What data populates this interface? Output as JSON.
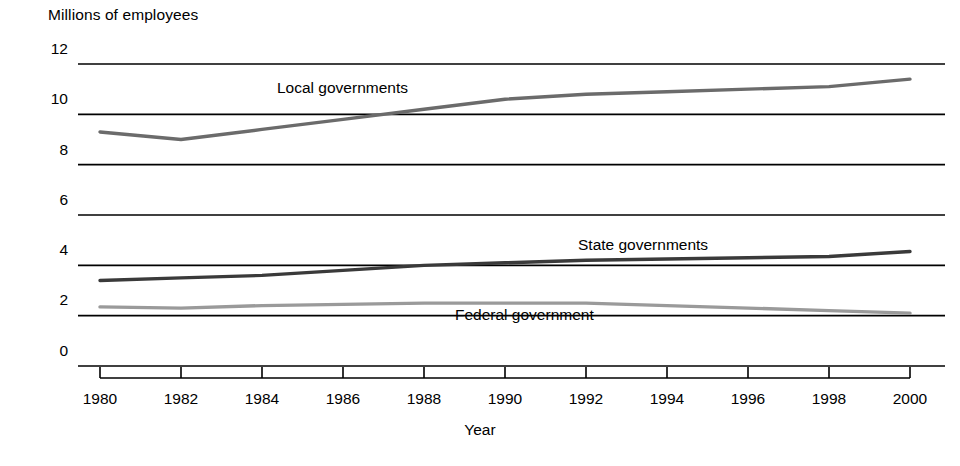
{
  "chart_data": {
    "type": "line",
    "title": "",
    "ylabel": "Millions of employees",
    "xlabel": "Year",
    "grid": true,
    "legend_position": "inline-labels",
    "xlim": [
      1980,
      2000
    ],
    "ylim": [
      0,
      12
    ],
    "yticks": [
      0,
      2,
      4,
      6,
      8,
      10,
      12
    ],
    "xticks": [
      1980,
      1982,
      1984,
      1986,
      1988,
      1990,
      1992,
      1994,
      1996,
      1998,
      2000
    ],
    "ytick_labels": [
      "0",
      "2",
      "4",
      "6",
      "8",
      "10",
      "12"
    ],
    "xtick_labels": [
      "1980",
      "1982",
      "1984",
      "1986",
      "1988",
      "1990",
      "1992",
      "1994",
      "1996",
      "1998",
      "2000"
    ],
    "x": [
      1980,
      1982,
      1984,
      1986,
      1988,
      1990,
      1992,
      1994,
      1996,
      1998,
      2000
    ],
    "series": [
      {
        "name": "Local governments",
        "color": "#6b6b6b",
        "values": [
          9.3,
          9.0,
          9.4,
          9.8,
          10.2,
          10.6,
          10.8,
          10.9,
          11.0,
          11.1,
          11.4
        ],
        "label_x": 1985.6,
        "label_y": 10.45
      },
      {
        "name": "State governments",
        "color": "#3a3a3a",
        "values": [
          3.4,
          3.5,
          3.6,
          3.8,
          4.0,
          4.1,
          4.2,
          4.25,
          4.3,
          4.35,
          4.55
        ],
        "label_x": 1992.6,
        "label_y": 4.75
      },
      {
        "name": "Federal government",
        "color": "#9a9a9a",
        "values": [
          2.35,
          2.3,
          2.4,
          2.45,
          2.5,
          2.5,
          2.5,
          2.4,
          2.3,
          2.2,
          2.1
        ],
        "label_x": 1988.0,
        "label_y": 1.95
      }
    ]
  },
  "axis": {
    "y_title": "Millions of employees",
    "x_title": "Year",
    "yticks": [
      "12",
      "10",
      "8",
      "6",
      "4",
      "2",
      "0"
    ],
    "xticks": [
      "1980",
      "1982",
      "1984",
      "1986",
      "1988",
      "1990",
      "1992",
      "1994",
      "1996",
      "1998",
      "2000"
    ]
  },
  "series_labels": {
    "local": "Local governments",
    "state": "State governments",
    "federal": "Federal government"
  }
}
